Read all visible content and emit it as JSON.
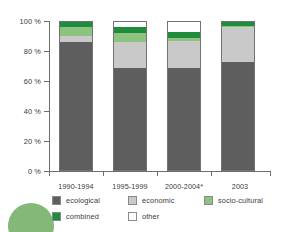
{
  "chart_data": {
    "type": "bar",
    "title": "",
    "subtitle": "",
    "xlabel": "",
    "ylabel": "",
    "stacked": true,
    "percent_stacked": true,
    "grid": false,
    "legend_position": "bottom",
    "ylim": [
      0,
      100
    ],
    "ytick_labels": [
      "100 %",
      "80 %",
      "60 %",
      "40 %",
      "20 %",
      "0 %"
    ],
    "ytick_values": [
      100,
      80,
      60,
      40,
      20,
      0
    ],
    "categories": [
      "1990-1994",
      "1995-1999",
      "2000-2004*",
      "2003"
    ],
    "series": [
      {
        "name": "ecological",
        "color": "#5e5e5e",
        "values": [
          86,
          69,
          69,
          73
        ]
      },
      {
        "name": "economic",
        "color": "#c9c9c9",
        "values": [
          4,
          17,
          18,
          23
        ]
      },
      {
        "name": "socio-cultural",
        "color": "#8cc47f",
        "values": [
          6,
          6,
          2,
          1
        ]
      },
      {
        "name": "combined",
        "color": "#1e8c3c",
        "values": [
          4,
          4,
          4,
          3
        ]
      },
      {
        "name": "other",
        "color": "#ffffff",
        "values": [
          0,
          4,
          7,
          0
        ]
      }
    ],
    "legend_entries": [
      {
        "label": "ecological",
        "color": "#5e5e5e"
      },
      {
        "label": "economic",
        "color": "#c9c9c9"
      },
      {
        "label": "socio-cultural",
        "color": "#8cc47f"
      },
      {
        "label": "combined",
        "color": "#1e8c3c"
      },
      {
        "label": "other",
        "color": "#ffffff"
      }
    ]
  },
  "axis": {
    "y": {
      "t100": "100 %",
      "t80": "80 %",
      "t60": "60 %",
      "t40": "40 %",
      "t20": "20 %",
      "t0": "0 %"
    },
    "x": {
      "c0": "1990-1994",
      "c1": "1995-1999",
      "c2": "2000-2004*",
      "c3": "2003"
    }
  },
  "legend": {
    "ecological": "ecological",
    "economic": "economic",
    "socio_cultural": "socio-cultural",
    "combined": "combined",
    "other": "other"
  }
}
